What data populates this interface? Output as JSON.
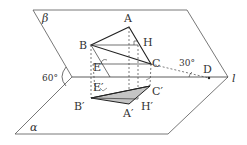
{
  "diagram": {
    "type": "dihedral-angle geometry figure",
    "planes": [
      {
        "name": "beta",
        "label": "β"
      },
      {
        "name": "alpha",
        "label": "α"
      }
    ],
    "edge_line": {
      "label": "l"
    },
    "points": [
      {
        "id": "A",
        "label": "A"
      },
      {
        "id": "B",
        "label": "B"
      },
      {
        "id": "C",
        "label": "C"
      },
      {
        "id": "H",
        "label": "H"
      },
      {
        "id": "E",
        "label": "E"
      },
      {
        "id": "D",
        "label": "D"
      },
      {
        "id": "A1",
        "label": "A′"
      },
      {
        "id": "B1",
        "label": "B′"
      },
      {
        "id": "C1",
        "label": "C′"
      },
      {
        "id": "H1",
        "label": "H′"
      },
      {
        "id": "E1",
        "label": "E′"
      }
    ],
    "angles": [
      {
        "name": "dihedral",
        "label": "60°"
      },
      {
        "name": "line-angle",
        "label": "30°"
      }
    ],
    "colors": {
      "line": "#333333",
      "shade": "#bdbdbd",
      "background": "#ffffff"
    }
  }
}
